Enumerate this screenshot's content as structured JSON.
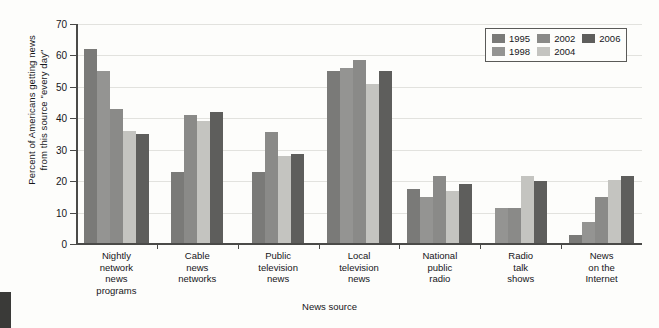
{
  "chart_data": {
    "type": "bar",
    "title": "",
    "xlabel": "News source",
    "ylabel_lines": [
      "Percent of Americans getting news",
      "from this source \"every day\""
    ],
    "ylabel": "Percent of Americans getting news from this source \"every day\"",
    "ylim": [
      0,
      70
    ],
    "yticks": [
      0,
      10,
      20,
      30,
      40,
      50,
      60,
      70
    ],
    "ytick_labels": [
      "0",
      "10",
      "20",
      "30",
      "40",
      "50",
      "60",
      "70"
    ],
    "grid": true,
    "legend_position": "top-right",
    "categories": [
      "Nightly network news programs",
      "Cable news networks",
      "Public television news",
      "Local television news",
      "National public radio",
      "Radio talk shows",
      "News on the Internet"
    ],
    "category_label_lines": [
      [
        "Nightly",
        "network",
        "news",
        "programs"
      ],
      [
        "Cable",
        "news",
        "networks"
      ],
      [
        "Public",
        "television",
        "news"
      ],
      [
        "Local",
        "television",
        "news"
      ],
      [
        "National",
        "public",
        "radio"
      ],
      [
        "Radio",
        "talk",
        "shows"
      ],
      [
        "News",
        "on the",
        "Internet"
      ]
    ],
    "series": [
      {
        "name": "1995",
        "color": "#7a7a78",
        "values": [
          62,
          23,
          23,
          55,
          17.5,
          null,
          3
        ]
      },
      {
        "name": "1998",
        "color": "#949492",
        "values": [
          55,
          null,
          null,
          56,
          15,
          11.5,
          7
        ]
      },
      {
        "name": "2002",
        "color": "#8a8a88",
        "values": [
          43,
          41,
          35.5,
          58.5,
          21.5,
          11.5,
          15
        ]
      },
      {
        "name": "2004",
        "color": "#c4c4c0",
        "values": [
          36,
          39,
          28,
          51,
          17,
          21.5,
          20.5
        ]
      },
      {
        "name": "2006",
        "color": "#5e5e5c",
        "values": [
          35,
          42,
          28.5,
          55,
          19,
          20,
          21.5
        ]
      }
    ],
    "legend_rows": [
      [
        {
          "label": "1995",
          "color": "#7a7a78"
        },
        {
          "label": "2002",
          "color": "#8a8a88"
        },
        {
          "label": "2006",
          "color": "#5e5e5c"
        }
      ],
      [
        {
          "label": "1998",
          "color": "#949492"
        },
        {
          "label": "2004",
          "color": "#c4c4c0"
        }
      ]
    ]
  }
}
